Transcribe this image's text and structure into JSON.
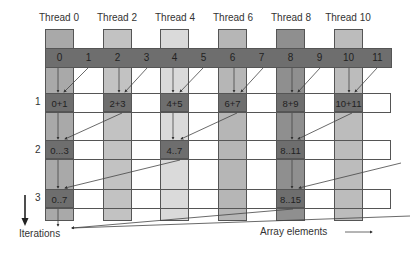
{
  "diagram": {
    "threads": [
      {
        "label": "Thread 0",
        "color": "#a9a9a9"
      },
      {
        "label": "Thread 2",
        "color": "#c2c2c2"
      },
      {
        "label": "Thread 4",
        "color": "#dadada"
      },
      {
        "label": "Thread 6",
        "color": "#b6b6b6"
      },
      {
        "label": "Thread 8",
        "color": "#8f8f8f"
      },
      {
        "label": "Thread 10",
        "color": "#bcbcbc"
      }
    ],
    "elements": [
      "0",
      "1",
      "2",
      "3",
      "4",
      "5",
      "6",
      "7",
      "8",
      "9",
      "10",
      "11"
    ],
    "iterations": [
      {
        "number": "1",
        "results": [
          "0+1",
          "2+3",
          "4+5",
          "6+7",
          "8+9",
          "10+11"
        ]
      },
      {
        "number": "2",
        "results": [
          "0...3",
          "4..7",
          "8..11"
        ]
      },
      {
        "number": "3",
        "results": [
          "0..7",
          "8..15"
        ]
      }
    ],
    "axis_labels": {
      "iterations": "Iterations",
      "array_elements": "Array elements"
    },
    "colors": {
      "element_row": "#6e6e6e",
      "result_cell": "#6e6e6e",
      "border": "#555555"
    }
  }
}
